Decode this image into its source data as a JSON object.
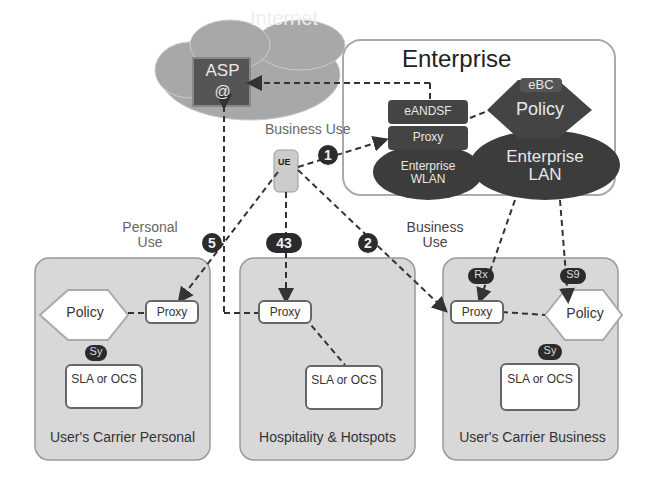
{
  "internet": {
    "label": "Internet",
    "asp": "ASP",
    "asp_icon": "@"
  },
  "enterprise": {
    "title": "Enterprise",
    "eandsf": "eANDSF",
    "proxy": "Proxy",
    "ebc": "eBC",
    "policy": "Policy",
    "wlan": "Enterprise WLAN",
    "lan": "Enterprise LAN"
  },
  "ue": {
    "label": "UE"
  },
  "labels": {
    "business_use_top": "Business Use",
    "personal_use": "Personal Use",
    "business_use_right": "Business Use"
  },
  "badges": {
    "b1": "1",
    "b2": "2",
    "b43": "43",
    "b5": "5"
  },
  "carriers": [
    {
      "name": "User's Carrier Personal",
      "policy": "Policy",
      "proxy": "Proxy",
      "sy": "Sy",
      "sla": "SLA or OCS"
    },
    {
      "name": "Hospitality & Hotspots",
      "proxy": "Proxy",
      "sla": "SLA or OCS"
    },
    {
      "name": "User's Carrier Business",
      "policy": "Policy",
      "proxy": "Proxy",
      "sy": "Sy",
      "rx": "Rx",
      "s9": "S9",
      "sla": "SLA or OCS"
    }
  ]
}
